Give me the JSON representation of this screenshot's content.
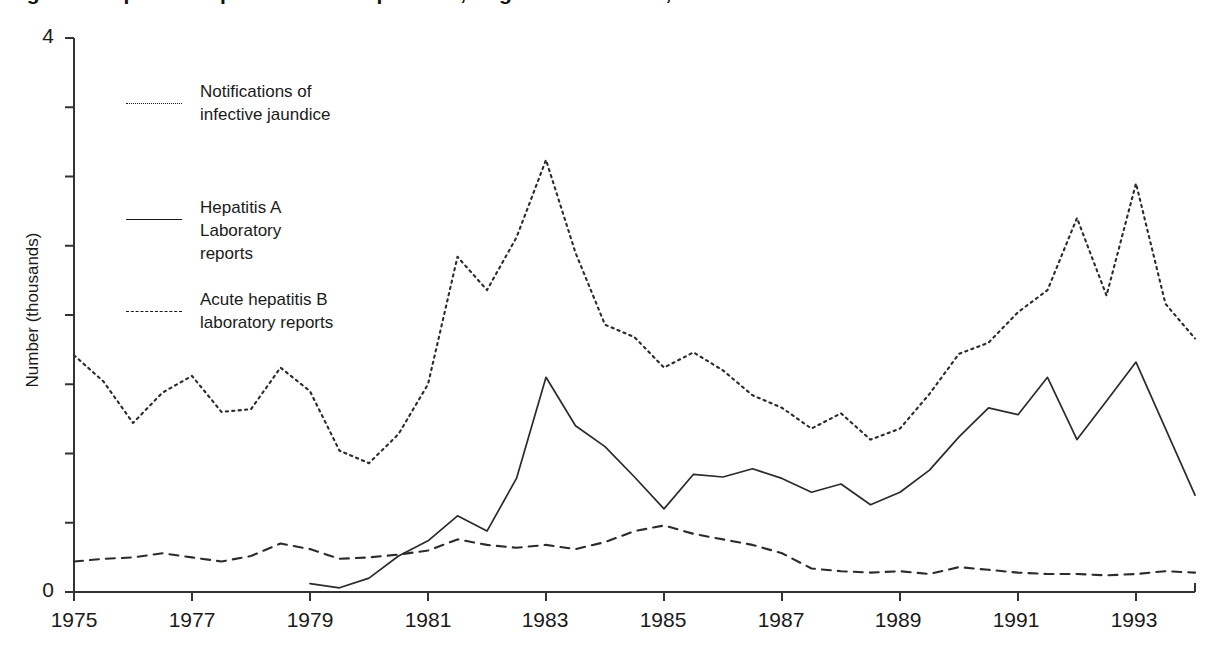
{
  "figure": {
    "title": "Figure 1  Reported hepatitis A and hepatitis B, England and Wales, 1975-1994",
    "background": "#ffffff",
    "ink_color": "#2b2b2b"
  },
  "axes": {
    "y": {
      "label": "Number (thousands)",
      "min": 0,
      "max": 4,
      "tick_labels": [
        "4",
        "0"
      ],
      "labeled_ticks": [
        4,
        0
      ],
      "minor_tick_step": 0.5,
      "all_ticks": [
        0,
        0.5,
        1,
        1.5,
        2,
        2.5,
        3,
        3.5,
        4
      ],
      "grid": "off"
    },
    "x": {
      "label": "",
      "min": 1975,
      "max": 1994,
      "tick_labels": [
        "1975",
        "1977",
        "1979",
        "1981",
        "1983",
        "1985",
        "1987",
        "1989",
        "1991",
        "1993"
      ],
      "tick_values": [
        1975,
        1977,
        1979,
        1981,
        1983,
        1985,
        1987,
        1989,
        1991,
        1993
      ],
      "grid": "off"
    }
  },
  "legend": {
    "position": "inside-top-left",
    "entries": [
      {
        "label": "Notifications of\ninfective jaundice",
        "style": "dotted",
        "series": "notifications"
      },
      {
        "label": "Hepatitis A\nLaboratory\nreports",
        "style": "solid",
        "series": "hepatitis_a"
      },
      {
        "label": "Acute hepatitis B\nlaboratory reports",
        "style": "dashed",
        "series": "hepatitis_b"
      }
    ]
  },
  "chart_data": {
    "type": "line",
    "title": "Figure 1  Reported hepatitis A and hepatitis B, England and Wales, 1975-1994",
    "xlabel": "",
    "ylabel": "Number (thousands)",
    "xlim": [
      1975,
      1994
    ],
    "ylim": [
      0,
      4
    ],
    "grid": false,
    "legend_position": "inside-top-left",
    "x": [
      1975,
      1975.5,
      1976,
      1976.5,
      1977,
      1977.5,
      1978,
      1978.5,
      1979,
      1979.5,
      1980,
      1980.5,
      1981,
      1981.5,
      1982,
      1982.5,
      1983,
      1983.5,
      1984,
      1984.5,
      1985,
      1985.5,
      1986,
      1986.5,
      1987,
      1987.5,
      1988,
      1988.5,
      1989,
      1989.5,
      1990,
      1990.5,
      1991,
      1991.5,
      1992,
      1992.5,
      1993,
      1993.5,
      1994
    ],
    "series": [
      {
        "name": "Notifications of infective jaundice",
        "style": "dotted",
        "values": [
          1.71,
          1.52,
          1.22,
          1.44,
          1.56,
          1.3,
          1.32,
          1.62,
          1.45,
          1.02,
          0.93,
          1.14,
          1.5,
          2.42,
          2.18,
          2.56,
          3.12,
          2.45,
          1.93,
          1.84,
          1.62,
          1.73,
          1.6,
          1.42,
          1.33,
          1.18,
          1.29,
          1.1,
          1.18,
          1.43,
          1.72,
          1.8,
          2.02,
          2.18,
          2.7,
          2.14,
          2.95,
          2.08,
          1.83
        ]
      },
      {
        "name": "Hepatitis A Laboratory reports",
        "style": "solid",
        "values": [
          null,
          null,
          null,
          null,
          null,
          null,
          null,
          null,
          0.06,
          0.03,
          0.1,
          0.26,
          0.37,
          0.55,
          0.44,
          0.82,
          1.55,
          1.2,
          1.05,
          0.83,
          0.6,
          0.85,
          0.83,
          0.89,
          0.82,
          0.72,
          0.78,
          0.63,
          0.72,
          0.88,
          1.12,
          1.33,
          1.28,
          1.55,
          1.1,
          1.38,
          1.66,
          1.18,
          0.7
        ]
      },
      {
        "name": "Acute hepatitis B laboratory reports",
        "style": "dashed",
        "values": [
          0.22,
          0.24,
          0.25,
          0.28,
          0.25,
          0.22,
          0.26,
          0.35,
          0.31,
          0.24,
          0.25,
          0.27,
          0.3,
          0.38,
          0.34,
          0.32,
          0.34,
          0.31,
          0.36,
          0.44,
          0.48,
          0.42,
          0.38,
          0.34,
          0.28,
          0.17,
          0.15,
          0.14,
          0.15,
          0.13,
          0.18,
          0.16,
          0.14,
          0.13,
          0.13,
          0.12,
          0.13,
          0.15,
          0.14
        ]
      }
    ]
  }
}
